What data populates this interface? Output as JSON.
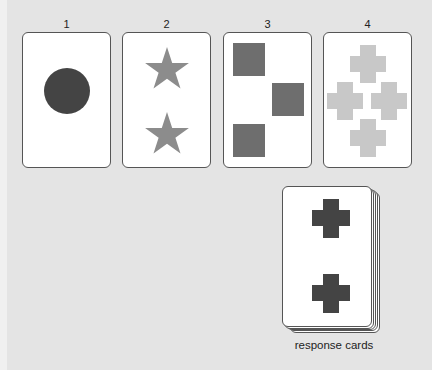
{
  "stimulus_cards": [
    {
      "label": "1",
      "shape": "circle",
      "count": 1,
      "color": "#444444"
    },
    {
      "label": "2",
      "shape": "star",
      "count": 2,
      "color": "#8c8c8c"
    },
    {
      "label": "3",
      "shape": "square",
      "count": 3,
      "color": "#6e6e6e"
    },
    {
      "label": "4",
      "shape": "cross",
      "count": 4,
      "color": "#c8c8c8"
    }
  ],
  "response_deck": {
    "caption": "response cards",
    "top_card": {
      "shape": "cross",
      "count": 2,
      "color": "#444444"
    }
  }
}
